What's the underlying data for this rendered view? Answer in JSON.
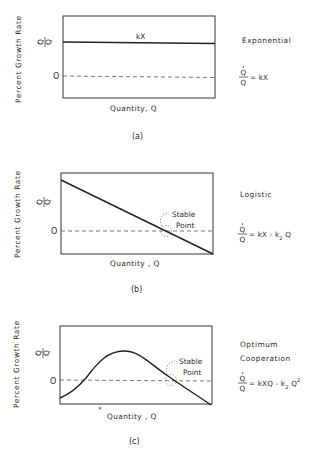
{
  "figure": {
    "panels": [
      {
        "id": "a",
        "caption": "(a)",
        "ylabel": "Percent  Growth  Rate",
        "y_symbol_num": "Q",
        "y_symbol_den": "Q",
        "zero_label": "O",
        "xlabel": "Quantity, Q",
        "line_label": "kX",
        "model_name": "Exponential",
        "equation_num": "Q",
        "equation_den": "Q",
        "equation_rhs": "= kX",
        "curve_type": "constant"
      },
      {
        "id": "b",
        "caption": "(b)",
        "ylabel": "Percent  Growth  Rate",
        "y_symbol_num": "Q",
        "y_symbol_den": "Q",
        "zero_label": "O",
        "xlabel": "Quantity , Q",
        "annotation": [
          "Stable",
          "Point"
        ],
        "model_name": "Logistic",
        "equation_num": "Q",
        "equation_den": "Q",
        "equation_rhs_parts": [
          "= kX - k",
          "2",
          " Q"
        ],
        "curve_type": "linear-decreasing"
      },
      {
        "id": "c",
        "caption": "(c)",
        "ylabel": "Percent  Growth  Rate",
        "y_symbol_num": "Q",
        "y_symbol_den": "Q",
        "zero_label": "O",
        "xlabel": "Quantity , Q",
        "x_marker": "*",
        "annotation": [
          "Stable",
          "Point"
        ],
        "model_name_lines": [
          "Optimum",
          "Cooperation"
        ],
        "equation_num": "Q",
        "equation_den": "Q",
        "equation_rhs_parts": [
          "= kXQ - k",
          "2",
          " Q",
          "2"
        ],
        "curve_type": "hump"
      }
    ]
  }
}
